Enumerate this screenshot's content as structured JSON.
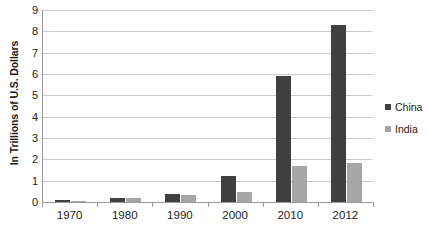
{
  "chart_data": {
    "type": "bar",
    "title": "",
    "subtitle": "",
    "xlabel": "",
    "ylabel": "In Trillions of U.S. Dollars",
    "categories": [
      "1970",
      "1980",
      "1990",
      "2000",
      "2010",
      "2012"
    ],
    "series": [
      {
        "name": "China",
        "color": "#404040",
        "values": [
          0.09,
          0.19,
          0.36,
          1.2,
          5.9,
          8.3
        ]
      },
      {
        "name": "India",
        "color": "#a6a6a6",
        "values": [
          0.06,
          0.19,
          0.32,
          0.47,
          1.7,
          1.85
        ]
      }
    ],
    "ylim": [
      0,
      9
    ],
    "ytick_values": [
      0,
      1,
      2,
      3,
      4,
      5,
      6,
      7,
      8,
      9
    ],
    "ytick_labels": [
      "0",
      "1",
      "2",
      "3",
      "4",
      "5",
      "6",
      "7",
      "8",
      "9"
    ],
    "grid": true,
    "grid_axis": "y",
    "legend_position": "right",
    "legend": [
      {
        "label": "China",
        "color": "#404040",
        "marker": "square"
      },
      {
        "label": "India",
        "color": "#a6a6a6",
        "marker": "square"
      }
    ],
    "background_color": "#ffffff",
    "axis_color": "#9a9a9a",
    "gridline_color": "#c9c9c9"
  }
}
